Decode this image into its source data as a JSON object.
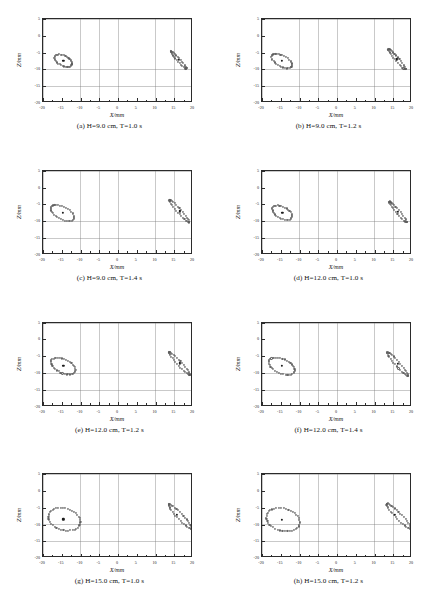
{
  "figure": {
    "rows": 4,
    "cols": 2,
    "marker_style": "open-circle",
    "center_marker_style": "filled-dot"
  },
  "axes": {
    "xlabel": "X/mm",
    "ylabel": "Z/mm",
    "xlim": [
      -20,
      20
    ],
    "ylim": [
      -20,
      5
    ],
    "xticks": [
      -20,
      -15,
      -10,
      -5,
      0,
      5,
      10,
      15,
      20
    ],
    "yticks": [
      5,
      0,
      -5,
      -10,
      -15,
      -20
    ],
    "xtick_labels": [
      "-20",
      "-15",
      "-10",
      "-5",
      "0",
      "5",
      "10",
      "15",
      "20"
    ],
    "ytick_labels": [
      "5",
      "0",
      "-5",
      "-10",
      "-15",
      "-20"
    ],
    "grid": true,
    "grid_step_x": 5,
    "grid_step_y": 5
  },
  "chart_data": {
    "type": "scatter",
    "xlabel": "X/mm",
    "ylabel": "Z/mm",
    "xlim": [
      -20,
      20
    ],
    "ylim": [
      -20,
      5
    ],
    "grid": true,
    "legend": "none",
    "panels": [
      {
        "id": "a",
        "caption": "(a) H=9.0 cm, T=1.0 s",
        "H_cm": 9.0,
        "T_s": 1.0,
        "clusters": [
          {
            "name": "left-orbit",
            "shape": "ellipse-ring",
            "center": [
              -14.6,
              -7.4
            ],
            "semi_major": 2.6,
            "semi_minor": 1.5,
            "angle_deg": -32,
            "n_points": 34,
            "center_marker": [
              -14.6,
              -7.4
            ]
          },
          {
            "name": "right-streak",
            "shape": "ellipse-ring",
            "center": [
              16.2,
              -7.2
            ],
            "semi_major": 3.3,
            "semi_minor": 0.42,
            "angle_deg": -52,
            "n_points": 34,
            "center_marker": [
              16.2,
              -7.2
            ]
          }
        ]
      },
      {
        "id": "b",
        "caption": "(b) H=9.0 cm, T=1.2 s",
        "H_cm": 9.0,
        "T_s": 1.2,
        "clusters": [
          {
            "name": "left-orbit",
            "shape": "ellipse-ring",
            "center": [
              -14.7,
              -7.5
            ],
            "semi_major": 3.1,
            "semi_minor": 1.6,
            "angle_deg": -33,
            "n_points": 34,
            "center_marker": [
              -14.7,
              -7.5
            ]
          },
          {
            "name": "right-streak",
            "shape": "ellipse-ring",
            "center": [
              16.0,
              -7.0
            ],
            "semi_major": 3.8,
            "semi_minor": 0.5,
            "angle_deg": -53,
            "n_points": 34,
            "center_marker": [
              16.0,
              -7.0
            ]
          }
        ]
      },
      {
        "id": "c",
        "caption": "(c) H=9.0 cm, T=1.4 s",
        "H_cm": 9.0,
        "T_s": 1.4,
        "clusters": [
          {
            "name": "left-orbit",
            "shape": "ellipse-ring",
            "center": [
              -14.8,
              -7.6
            ],
            "semi_major": 3.5,
            "semi_minor": 1.8,
            "angle_deg": -31,
            "n_points": 36,
            "center_marker": [
              -14.8,
              -7.6
            ]
          },
          {
            "name": "right-streak",
            "shape": "ellipse-ring",
            "center": [
              16.4,
              -7.1
            ],
            "semi_major": 4.2,
            "semi_minor": 0.55,
            "angle_deg": -52,
            "n_points": 36,
            "center_marker": [
              16.4,
              -7.1
            ]
          }
        ]
      },
      {
        "id": "d",
        "caption": "(d) H=12.0 cm, T=1.0 s",
        "H_cm": 12.0,
        "T_s": 1.0,
        "clusters": [
          {
            "name": "left-orbit",
            "shape": "ellipse-ring",
            "center": [
              -14.6,
              -7.5
            ],
            "semi_major": 3.0,
            "semi_minor": 1.7,
            "angle_deg": -34,
            "n_points": 34,
            "center_marker": [
              -14.6,
              -7.5
            ]
          },
          {
            "name": "right-streak",
            "shape": "ellipse-ring",
            "center": [
              16.3,
              -7.3
            ],
            "semi_major": 3.9,
            "semi_minor": 0.5,
            "angle_deg": -53,
            "n_points": 34,
            "center_marker": [
              16.3,
              -7.3
            ]
          }
        ]
      },
      {
        "id": "e",
        "caption": "(e) H=12.0 cm, T=1.2 s",
        "H_cm": 12.0,
        "T_s": 1.2,
        "clusters": [
          {
            "name": "left-orbit",
            "shape": "ellipse-ring",
            "center": [
              -14.6,
              -8.0
            ],
            "semi_major": 3.6,
            "semi_minor": 2.0,
            "angle_deg": -30,
            "n_points": 38,
            "center_marker": [
              -14.6,
              -8.0
            ]
          },
          {
            "name": "right-streak",
            "shape": "ellipse-ring",
            "center": [
              16.4,
              -7.2
            ],
            "semi_major": 4.4,
            "semi_minor": 0.6,
            "angle_deg": -51,
            "n_points": 38,
            "center_marker": [
              16.4,
              -7.2
            ]
          }
        ]
      },
      {
        "id": "f",
        "caption": "(f) H=12.0 cm, T=1.4 s",
        "H_cm": 12.0,
        "T_s": 1.4,
        "clusters": [
          {
            "name": "left-orbit",
            "shape": "ellipse-ring",
            "center": [
              -14.7,
              -8.0
            ],
            "semi_major": 3.8,
            "semi_minor": 2.1,
            "angle_deg": -29,
            "n_points": 38,
            "center_marker": [
              -14.7,
              -8.0
            ]
          },
          {
            "name": "right-streak",
            "shape": "ellipse-ring",
            "center": [
              16.2,
              -7.4
            ],
            "semi_major": 4.5,
            "semi_minor": 0.62,
            "angle_deg": -52,
            "n_points": 38,
            "center_marker": [
              16.2,
              -7.4
            ]
          }
        ]
      },
      {
        "id": "g",
        "caption": "(g) H=15.0 cm, T=1.0 s",
        "H_cm": 15.0,
        "T_s": 1.0,
        "clusters": [
          {
            "name": "left-orbit",
            "shape": "ellipse-ring",
            "center": [
              -14.3,
              -8.4
            ],
            "semi_major": 4.4,
            "semi_minor": 3.2,
            "angle_deg": -22,
            "n_points": 42,
            "center_marker": [
              -14.6,
              -8.4
            ]
          },
          {
            "name": "right-streak",
            "shape": "ellipse-ring",
            "center": [
              16.6,
              -7.6
            ],
            "semi_major": 4.8,
            "semi_minor": 0.8,
            "angle_deg": -50,
            "n_points": 42,
            "center_marker": [
              15.6,
              -7.0
            ]
          }
        ]
      },
      {
        "id": "h",
        "caption": "(h) H=15.0 cm, T=1.2 s",
        "H_cm": 15.0,
        "T_s": 1.2,
        "clusters": [
          {
            "name": "left-orbit",
            "shape": "ellipse-ring",
            "center": [
              -14.4,
              -8.5
            ],
            "semi_major": 4.6,
            "semi_minor": 3.3,
            "angle_deg": -20,
            "n_points": 42,
            "center_marker": [
              -14.8,
              -8.5
            ]
          },
          {
            "name": "right-streak",
            "shape": "ellipse-ring",
            "center": [
              16.5,
              -7.5
            ],
            "semi_major": 5.0,
            "semi_minor": 0.85,
            "angle_deg": -49,
            "n_points": 42,
            "center_marker": [
              15.4,
              -7.0
            ]
          }
        ]
      }
    ]
  }
}
